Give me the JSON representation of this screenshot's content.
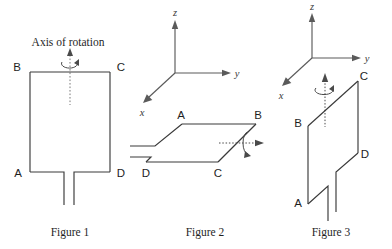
{
  "figures": [
    {
      "caption": "Figure 1",
      "annotation": "Axis of rotation",
      "vertices": {
        "a": "A",
        "b": "B",
        "c": "C",
        "d": "D"
      },
      "axes": [],
      "rotation_axis": "vertical-dotted",
      "loop_shape": "rectangle-with-leads-downward",
      "axis_orientation": "vertical, through center of loop"
    },
    {
      "caption": "Figure 2",
      "annotation": "",
      "vertices": {
        "a": "A",
        "b": "B",
        "c": "C",
        "d": "D"
      },
      "axes": [
        {
          "label": "z",
          "direction": "up"
        },
        {
          "label": "y",
          "direction": "right"
        },
        {
          "label": "x",
          "direction": "down-left"
        }
      ],
      "rotation_axis": "horizontal-dotted-along-y",
      "loop_shape": "parallelogram-horizontal-with-leads-left",
      "axis_orientation": "horizontal, along y, through loop"
    },
    {
      "caption": "Figure 3",
      "annotation": "",
      "vertices": {
        "a": "A",
        "b": "B",
        "c": "C",
        "d": "D"
      },
      "axes": [
        {
          "label": "z",
          "direction": "up"
        },
        {
          "label": "y",
          "direction": "right"
        },
        {
          "label": "x",
          "direction": "down-left"
        }
      ],
      "rotation_axis": "vertical-dotted-along-z",
      "loop_shape": "parallelogram-vertical-with-leads-downward",
      "axis_orientation": "vertical, along z, through loop"
    }
  ],
  "colors": {
    "line": "#3a3a3a",
    "axis": "#5a5a5a",
    "dotted": "#7a7a7a",
    "label": "#1f1f1f",
    "background": "#ffffff"
  }
}
